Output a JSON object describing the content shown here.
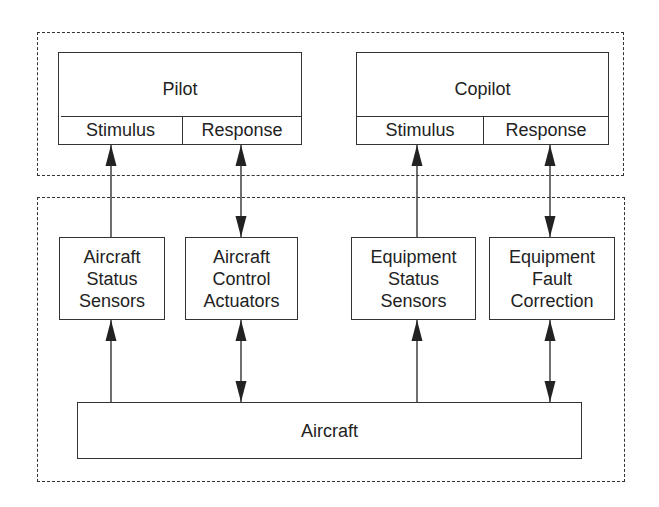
{
  "diagram": {
    "crew_group": {
      "pilot": {
        "title": "Pilot",
        "stimulus": "Stimulus",
        "response": "Response"
      },
      "copilot": {
        "title": "Copilot",
        "stimulus": "Stimulus",
        "response": "Response"
      }
    },
    "system_group": {
      "components": [
        {
          "id": "aircraft-status-sensors",
          "lines": [
            "Aircraft",
            "Status",
            "Sensors"
          ]
        },
        {
          "id": "aircraft-control-actuators",
          "lines": [
            "Aircraft",
            "Control",
            "Actuators"
          ]
        },
        {
          "id": "equipment-status-sensors",
          "lines": [
            "Equipment",
            "Status",
            "Sensors"
          ]
        },
        {
          "id": "equipment-fault-correction",
          "lines": [
            "Equipment",
            "Fault",
            "Correction"
          ]
        }
      ],
      "aircraft": {
        "title": "Aircraft"
      }
    },
    "connections": [
      {
        "from": "Aircraft",
        "to": "Aircraft Status Sensors",
        "direction": "up"
      },
      {
        "from": "Aircraft Status Sensors",
        "to": "Pilot Stimulus",
        "direction": "up"
      },
      {
        "from": "Pilot Response",
        "to": "Aircraft Control Actuators",
        "direction": "bidirectional"
      },
      {
        "from": "Aircraft Control Actuators",
        "to": "Aircraft",
        "direction": "bidirectional"
      },
      {
        "from": "Aircraft",
        "to": "Equipment Status Sensors",
        "direction": "up"
      },
      {
        "from": "Equipment Status Sensors",
        "to": "Copilot Stimulus",
        "direction": "up"
      },
      {
        "from": "Copilot Response",
        "to": "Equipment Fault Correction",
        "direction": "bidirectional"
      },
      {
        "from": "Equipment Fault Correction",
        "to": "Aircraft",
        "direction": "bidirectional"
      }
    ],
    "colors": {
      "line": "#333333",
      "background": "#ffffff"
    }
  }
}
